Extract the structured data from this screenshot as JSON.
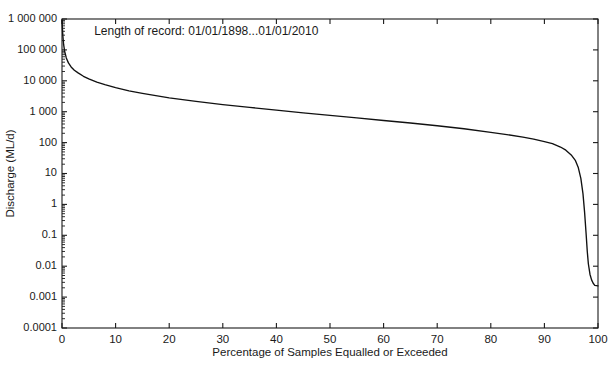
{
  "chart_data": {
    "type": "line",
    "title": "",
    "subtitle": "",
    "xlabel": "Percentage of Samples Equalled or Exceeded",
    "ylabel": "Discharge (ML/d)",
    "yscale": "log",
    "xscale": "linear",
    "xlim": [
      0,
      100
    ],
    "ylim": [
      0.0001,
      1000000
    ],
    "grid": false,
    "legend": null,
    "annotations": [
      {
        "name": "length-of-record",
        "text": "Length of record: 01/01/1898...01/01/2010",
        "x": 6,
        "y": 300000
      }
    ],
    "xticks": [
      0,
      10,
      20,
      30,
      40,
      50,
      60,
      70,
      80,
      90,
      100
    ],
    "xtick_labels": [
      "0",
      "10",
      "20",
      "30",
      "40",
      "50",
      "60",
      "70",
      "80",
      "90",
      "100"
    ],
    "yticks": [
      0.0001,
      0.001,
      0.01,
      0.1,
      1,
      10,
      100,
      1000,
      10000,
      100000,
      1000000
    ],
    "ytick_labels": [
      "0.0001",
      "0.001",
      "0.01",
      "0.1",
      "1",
      "10",
      "100",
      "1 000",
      "10 000",
      "100 000",
      "1 000 000"
    ],
    "series": [
      {
        "name": "flow-duration-curve",
        "color": "#111111",
        "x": [
          0,
          0.15,
          0.3,
          0.5,
          0.8,
          1.2,
          1.7,
          2.3,
          3,
          4,
          5,
          6.5,
          8,
          10,
          12.5,
          15,
          17.5,
          20,
          25,
          30,
          35,
          40,
          45,
          50,
          55,
          60,
          65,
          70,
          75,
          80,
          83,
          86,
          88,
          90,
          91.5,
          93,
          94,
          95,
          95.8,
          96.3,
          96.8,
          97.2,
          97.5,
          97.8,
          98,
          98.2,
          98.5,
          98.8,
          99.1,
          99.4,
          100
        ],
        "y": [
          900000,
          300000,
          150000,
          90000,
          55000,
          38000,
          28000,
          22000,
          18000,
          14000,
          11500,
          9000,
          7500,
          6000,
          4700,
          3900,
          3300,
          2800,
          2150,
          1700,
          1380,
          1120,
          920,
          760,
          630,
          520,
          430,
          350,
          280,
          215,
          182,
          150,
          130,
          108,
          92,
          72,
          57,
          40,
          26,
          16,
          7,
          2.2,
          0.55,
          0.1,
          0.03,
          0.012,
          0.0055,
          0.0036,
          0.0028,
          0.0024,
          0.0023
        ]
      }
    ]
  },
  "layout": {
    "plot_left": 62,
    "plot_right": 598,
    "plot_top": 19,
    "plot_bottom": 328
  }
}
